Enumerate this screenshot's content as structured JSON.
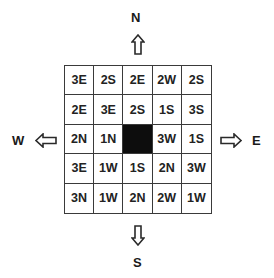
{
  "compass": {
    "north": "N",
    "south": "S",
    "east": "E",
    "west": "W"
  },
  "grid": {
    "rows": [
      [
        "3E",
        "2S",
        "2E",
        "2W",
        "2S"
      ],
      [
        "2E",
        "3E",
        "2S",
        "1S",
        "3S"
      ],
      [
        "2N",
        "1N",
        "",
        "3W",
        "1S"
      ],
      [
        "3E",
        "1W",
        "1S",
        "2N",
        "3W"
      ],
      [
        "3N",
        "1W",
        "2N",
        "2W",
        "1W"
      ]
    ],
    "black_cell": {
      "row": 2,
      "col": 2
    },
    "colors": {
      "black_cell": "#0d0d0d",
      "lines": "#3a3a3a"
    }
  }
}
